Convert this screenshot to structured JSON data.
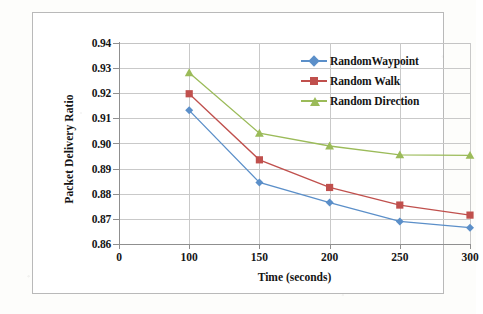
{
  "chart_data": {
    "type": "line",
    "title": "",
    "xlabel": "Time (seconds)",
    "ylabel": "Packet Delivery Ratio",
    "x": [
      100,
      150,
      200,
      250,
      300
    ],
    "xtick_labels": [
      "0",
      "100",
      "150",
      "200",
      "250",
      "300"
    ],
    "xtick_values": [
      0,
      100,
      150,
      200,
      250,
      300
    ],
    "ytick_labels": [
      "0.86",
      "0.87",
      "0.88",
      "0.89",
      "0.90",
      "0.91",
      "0.92",
      "0.93",
      "0.94"
    ],
    "ytick_values": [
      0.86,
      0.87,
      0.88,
      0.89,
      0.9,
      0.91,
      0.92,
      0.93,
      0.94
    ],
    "ylim": [
      0.86,
      0.94
    ],
    "grid": "horizontal-and-vertical",
    "legend_position": "upper-right-inside",
    "series": [
      {
        "name": "RandomWaypoint",
        "color": "#5b8fc9",
        "marker": "diamond",
        "values": [
          0.9132,
          0.8845,
          0.8765,
          0.869,
          0.8665
        ]
      },
      {
        "name": "Random Walk",
        "color": "#c0504d",
        "marker": "square",
        "values": [
          0.9198,
          0.8935,
          0.8825,
          0.8755,
          0.8715
        ]
      },
      {
        "name": "Random Direction",
        "color": "#9bbb59",
        "marker": "triangle",
        "values": [
          0.9282,
          0.9041,
          0.899,
          0.8955,
          0.8953
        ]
      }
    ]
  }
}
